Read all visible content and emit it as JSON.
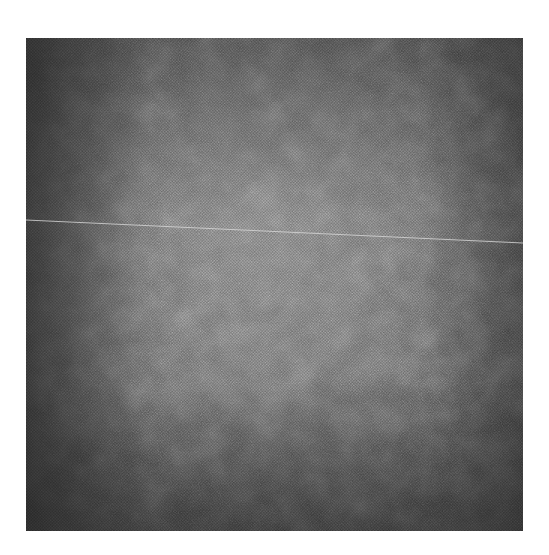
{
  "image": {
    "description": "Grayscale halftone texture photograph with a faint thin light line crossing horizontally near the upper third",
    "colors": {
      "dark": "#3a3a3a",
      "mid": "#6e6e6e",
      "light": "#9a9a9a",
      "line": "#d8d8d8",
      "background": "#ffffff"
    },
    "line": {
      "x1": 0,
      "y1": 182,
      "x2": 497,
      "y2": 205
    }
  }
}
